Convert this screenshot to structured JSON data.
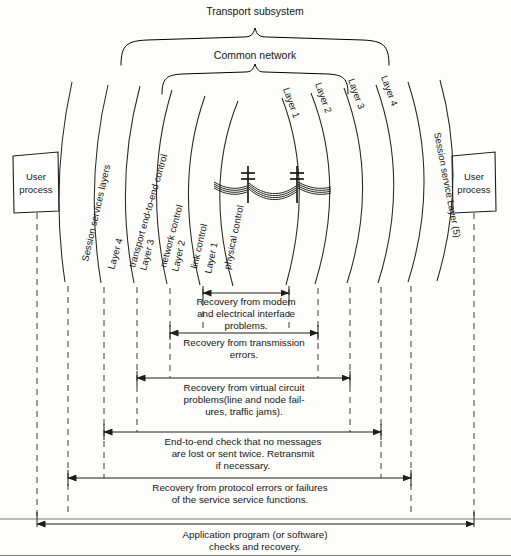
{
  "figure": {
    "title": "Transport subsystem",
    "subtitle": "Common network"
  },
  "braces": [
    {
      "name": "transport-subsystem-brace",
      "label": "Transport subsystem"
    },
    {
      "name": "common-network-brace",
      "label": "Common network"
    }
  ],
  "boxes": {
    "left_user_process": {
      "line1": "User",
      "line2": "process"
    },
    "right_user_process": {
      "line1": "User",
      "line2": "process"
    }
  },
  "left_layers": [
    {
      "layer": "",
      "name": "Session services layers"
    },
    {
      "layer": "Layer 4",
      "name": "transport end-to-end control"
    },
    {
      "layer": "Layer 3",
      "name": "network control"
    },
    {
      "layer": "Layer 2",
      "name": "link control"
    },
    {
      "layer": "Layer 1",
      "name": "physical control"
    }
  ],
  "right_layers": [
    {
      "layer": "Layer 1",
      "name": ""
    },
    {
      "layer": "Layer 2",
      "name": ""
    },
    {
      "layer": "Layer 3",
      "name": ""
    },
    {
      "layer": "Layer 4",
      "name": ""
    },
    {
      "layer": "",
      "name": "Session service Layer (5)"
    }
  ],
  "center_symbol": "transmission-line-poles",
  "annotations": [
    {
      "id": "recovery-modem",
      "lines": [
        "Recovery from modem",
        "and electrical interface",
        "problems."
      ]
    },
    {
      "id": "recovery-transmission",
      "lines": [
        "Recovery from transmission",
        "errors."
      ]
    },
    {
      "id": "recovery-virtual-circuit",
      "lines": [
        "Recovery from virtual circuit",
        "problems(line and node fail-",
        "ures, traffic jams)."
      ]
    },
    {
      "id": "end-to-end-check",
      "lines": [
        "End-to-end check that no messages",
        "are lost or sent twice.  Retransmit",
        "if necessary."
      ]
    },
    {
      "id": "recovery-protocol",
      "lines": [
        "Recovery from protocol errors or failures",
        "of the service service functions."
      ]
    },
    {
      "id": "application-program",
      "lines": [
        "Application program (or software)",
        "checks and recovery."
      ]
    }
  ],
  "colors": {
    "ink": "#161616",
    "line": "#1d1d1d",
    "dash": "#3b3b3b",
    "background": "#fdfdfb"
  }
}
